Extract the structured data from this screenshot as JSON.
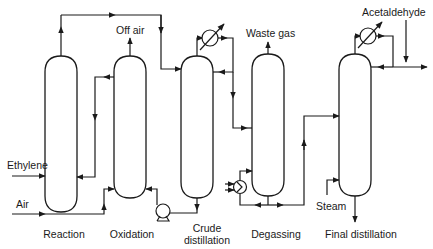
{
  "diagram": {
    "type": "process-flow-diagram",
    "units": [
      {
        "id": "reaction",
        "label": "Reaction"
      },
      {
        "id": "oxidation",
        "label": "Oxidation"
      },
      {
        "id": "crude_distillation",
        "label_line1": "Crude",
        "label_line2": "distillation"
      },
      {
        "id": "degassing",
        "label": "Degassing"
      },
      {
        "id": "final_distillation",
        "label": "Final distillation"
      }
    ],
    "streams": {
      "ethylene": "Ethylene",
      "air": "Air",
      "off_air": "Off air",
      "waste_gas": "Waste gas",
      "steam": "Steam",
      "acetaldehyde": "Acetaldehyde"
    },
    "equipment_icons": [
      "condenser-icon",
      "condenser-icon",
      "pump-icon",
      "heat-exchanger-icon"
    ],
    "colors": {
      "line": "#1a1a1a",
      "background": "#ffffff"
    }
  }
}
